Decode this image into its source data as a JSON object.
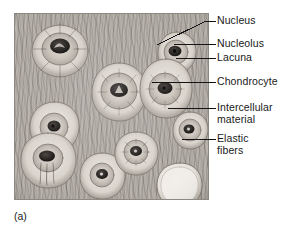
{
  "figure": {
    "caption": "(a)",
    "panel": {
      "background_color": "#b9b4ad",
      "ink_color": "#3a3531",
      "border_color": "#8e8882"
    },
    "labels": [
      {
        "id": "nucleus",
        "text": "Nucleus"
      },
      {
        "id": "nucleolus",
        "text": "Nucleolus"
      },
      {
        "id": "lacuna",
        "text": "Lacuna"
      },
      {
        "id": "chondrocyte",
        "text": "Chondrocyte"
      },
      {
        "id": "intercellular-material",
        "text": "Intercellular\nmaterial"
      },
      {
        "id": "elastic-fibers",
        "text": "Elastic\nfibers"
      }
    ],
    "structures": [
      {
        "id": "chondrocyte-top-left",
        "type": "chondrocyte",
        "cx": 46,
        "cy": 38,
        "rx": 29,
        "ry": 27
      },
      {
        "id": "chondrocyte-center",
        "type": "chondrocyte",
        "cx": 105,
        "cy": 79,
        "rx": 26,
        "ry": 27
      },
      {
        "id": "chondrocyte-upper-right",
        "type": "chondrocyte",
        "cx": 163,
        "cy": 40,
        "rx": 18,
        "ry": 19
      },
      {
        "id": "chondrocyte-right-mid",
        "type": "chondrocyte",
        "cx": 152,
        "cy": 76,
        "rx": 25,
        "ry": 27
      },
      {
        "id": "chondrocyte-left-upper",
        "type": "chondrocyte",
        "cx": 40,
        "cy": 115,
        "rx": 25,
        "ry": 24
      },
      {
        "id": "chondrocyte-left-lower",
        "type": "chondrocyte",
        "cx": 34,
        "cy": 148,
        "rx": 27,
        "ry": 26
      },
      {
        "id": "chondrocyte-bottom-mid",
        "type": "chondrocyte",
        "cx": 88,
        "cy": 163,
        "rx": 22,
        "ry": 22
      },
      {
        "id": "chondrocyte-bottom-left",
        "type": "chondrocyte",
        "cx": 122,
        "cy": 140,
        "rx": 21,
        "ry": 20
      },
      {
        "id": "chondrocyte-far-right",
        "type": "chondrocyte",
        "cx": 176,
        "cy": 117,
        "rx": 17,
        "ry": 17
      },
      {
        "id": "empty-lacuna-bottom-right",
        "type": "empty-lacuna",
        "cx": 165,
        "cy": 172,
        "rx": 22,
        "ry": 21
      }
    ]
  }
}
